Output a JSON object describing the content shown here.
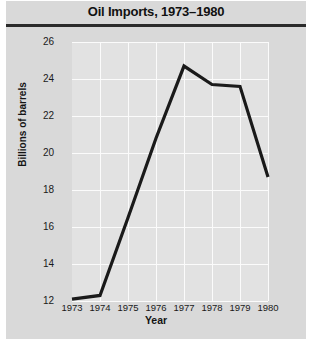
{
  "chart_data": {
    "type": "line",
    "title": "Oil Imports, 1973–1980",
    "xlabel": "Year",
    "ylabel": "Billions of barrels",
    "categories": [
      "1973",
      "1974",
      "1975",
      "1976",
      "1977",
      "1978",
      "1979",
      "1980"
    ],
    "x": [
      1973,
      1974,
      1975,
      1976,
      1977,
      1978,
      1979,
      1980
    ],
    "values": [
      12.1,
      12.3,
      16.5,
      20.8,
      24.7,
      23.7,
      23.6,
      18.7
    ],
    "series": [
      {
        "name": "Oil Imports",
        "values": [
          12.1,
          12.3,
          16.5,
          20.8,
          24.7,
          23.7,
          23.6,
          18.7
        ]
      }
    ],
    "xlim": [
      1973,
      1980
    ],
    "ylim": [
      12,
      26
    ],
    "yticks": [
      12,
      14,
      16,
      18,
      20,
      22,
      24,
      26
    ],
    "ytick_labels": [
      "12",
      "14",
      "16",
      "18",
      "20",
      "22",
      "24",
      "26"
    ],
    "xticks": [
      1973,
      1974,
      1975,
      1976,
      1977,
      1978,
      1979,
      1980
    ],
    "xtick_labels": [
      "1973",
      "1974",
      "1975",
      "1976",
      "1977",
      "1978",
      "1979",
      "1980"
    ],
    "grid": true,
    "legend": false,
    "legend_position": "none",
    "line_color": "#1a1a1a",
    "line_width": 3,
    "plot_background": "#e2e2e2",
    "figure_background": "#d9d9d9",
    "gridline_color": "#fbfbfb"
  }
}
